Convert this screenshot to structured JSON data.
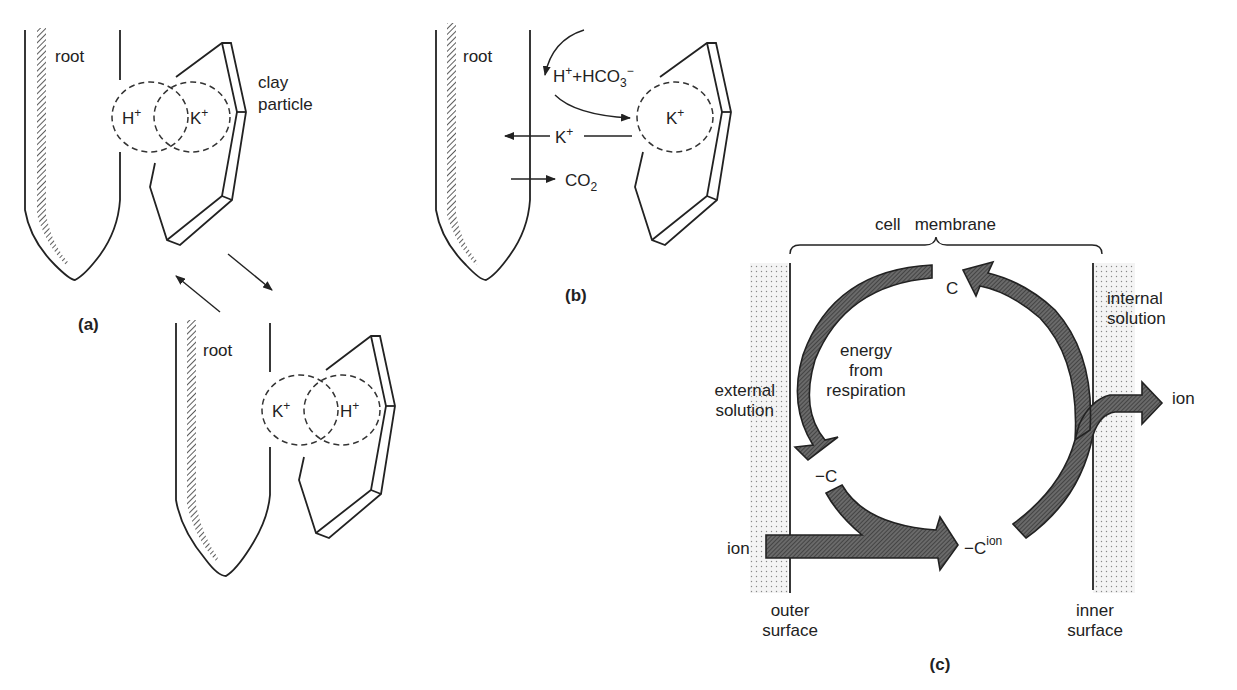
{
  "figure": {
    "panel_a": {
      "caption": "(a)",
      "top": {
        "root_label": "root",
        "clay_label_line1": "clay",
        "clay_label_line2": "particle",
        "ion_left": "H+",
        "ion_right": "K+"
      },
      "bottom": {
        "root_label": "root",
        "ion_left": "K+",
        "ion_right": "H+"
      }
    },
    "panel_b": {
      "caption": "(b)",
      "root_label": "root",
      "reaction_label": "H+ + HCO3−",
      "k_ion_bound": "K+",
      "k_ion_moving": "K+",
      "co2_label": "CO2"
    },
    "panel_c": {
      "caption": "(c)",
      "membrane_label": "cell   membrane",
      "external_label_line1": "external",
      "external_label_line2": "solution",
      "internal_label_line1": "internal",
      "internal_label_line2": "solution",
      "outer_label_line1": "outer",
      "outer_label_line2": "surface",
      "inner_label_line1": "inner",
      "inner_label_line2": "surface",
      "energy_line1": "energy",
      "energy_line2": "from",
      "energy_line3": "respiration",
      "carrier_label": "C",
      "neg_carrier_label": "−C",
      "complex_base": "−C",
      "complex_sup": "ion",
      "ion_in_label": "ion",
      "ion_out_label": "ion"
    }
  }
}
